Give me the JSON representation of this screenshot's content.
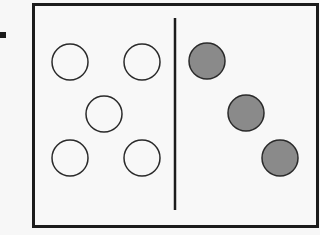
{
  "diagram": {
    "colors": {
      "background": "#f7f7f7",
      "frame_border": "#1c1c1c",
      "open_circle_stroke": "#2a2a2a",
      "open_circle_fill": "#f8f8f8",
      "filled_circle_fill": "#8a8a8a",
      "filled_circle_stroke": "#2a2a2a",
      "divider": "#1c1c1c"
    },
    "divider": {
      "x": 175,
      "y1": 18,
      "y2": 210
    },
    "left_group": {
      "label": "open circles",
      "count": 5,
      "circles": [
        {
          "cx": 70,
          "cy": 62,
          "r": 18
        },
        {
          "cx": 142,
          "cy": 62,
          "r": 18
        },
        {
          "cx": 104,
          "cy": 114,
          "r": 18
        },
        {
          "cx": 70,
          "cy": 158,
          "r": 18
        },
        {
          "cx": 142,
          "cy": 158,
          "r": 18
        }
      ]
    },
    "right_group": {
      "label": "filled circles",
      "count": 3,
      "circles": [
        {
          "cx": 207,
          "cy": 61,
          "r": 18
        },
        {
          "cx": 246,
          "cy": 113,
          "r": 18
        },
        {
          "cx": 280,
          "cy": 158,
          "r": 18
        }
      ]
    }
  }
}
